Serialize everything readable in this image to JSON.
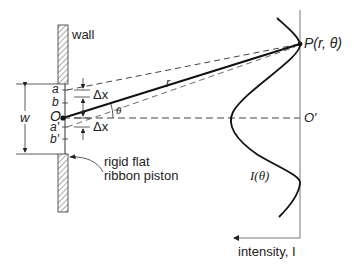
{
  "diagram": {
    "labels": {
      "wall": "wall",
      "point_P": "P(r, θ)",
      "r": "r",
      "theta": "θ",
      "origin": "O",
      "origin_prime": "O′",
      "width": "w",
      "a": "a",
      "b": "b",
      "a_prime": "a′",
      "b_prime": "b′",
      "delta_x_top": "Δx",
      "delta_x_bottom": "Δx",
      "piston_line1": "rigid flat",
      "piston_line2": "ribbon piston",
      "intensity_curve": "I(θ)",
      "intensity_axis": "intensity, I"
    },
    "colors": {
      "ink": "#1a1a1a",
      "dashed": "#444444",
      "axis": "#777777",
      "hatch": "#555555"
    }
  }
}
